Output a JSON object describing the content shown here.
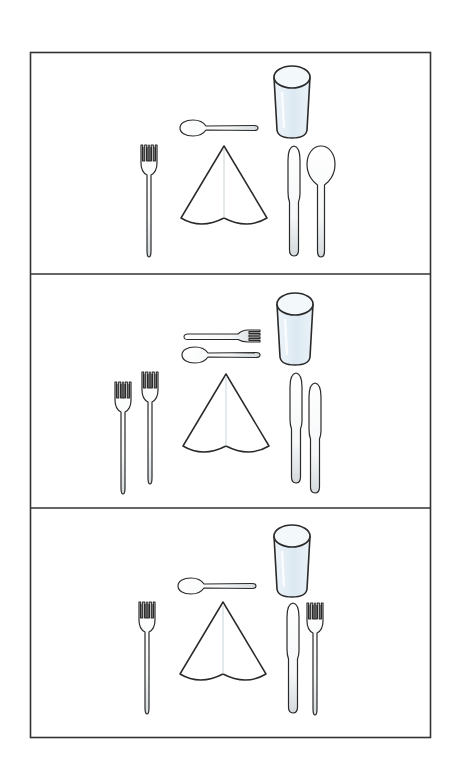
{
  "figure": {
    "frame": {
      "x": 30,
      "y": 52,
      "width": 401,
      "height": 686,
      "stroke": "#333333"
    },
    "colors": {
      "line": "#2a2a2a",
      "glass_fill": "#e3eef5",
      "cutlery_fill": "#f4f6f7",
      "shade": "#d7dde0",
      "background": "#ffffff"
    },
    "panels": [
      {
        "label": "Setting 1: fork, napkin, dessert spoon, glass, knife, spoon",
        "items": [
          "dessert-spoon",
          "glass",
          "dinner-fork",
          "napkin",
          "knife",
          "soup-spoon"
        ]
      },
      {
        "label": "Setting 2: two forks, napkin, dessert fork, dessert spoon, glass, two knives",
        "items": [
          "dessert-fork",
          "dessert-spoon",
          "glass",
          "dinner-fork",
          "salad-fork",
          "napkin",
          "dinner-knife",
          "second-knife"
        ]
      },
      {
        "label": "Setting 3: fork, napkin, dessert spoon, glass, knife, fork",
        "items": [
          "dessert-spoon",
          "glass",
          "dinner-fork",
          "napkin",
          "knife",
          "fork-right"
        ]
      }
    ]
  }
}
